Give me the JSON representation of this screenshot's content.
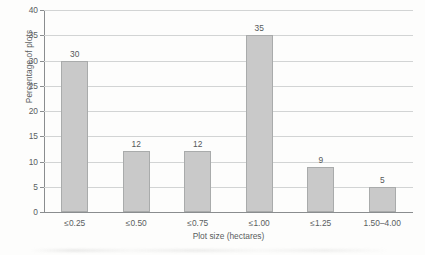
{
  "chart_data": {
    "type": "bar",
    "title": "",
    "subtitle": "",
    "xlabel": "Plot size (hectares)",
    "ylabel": "Percentage of plots",
    "categories": [
      "≤0.25",
      "≤0.50",
      "≤0.75",
      "≤1.00",
      "≤1.25",
      "1.50–4.00"
    ],
    "values": [
      30,
      12,
      12,
      35,
      9,
      5
    ],
    "data_labels": [
      "30",
      "12",
      "12",
      "35",
      "9",
      "5"
    ],
    "ylim": [
      0,
      40
    ],
    "ytick_step": 5,
    "ytick_labels": [
      "0",
      "5",
      "10",
      "15",
      "20",
      "25",
      "30",
      "35",
      "40"
    ],
    "ytick_values": [
      0,
      5,
      10,
      15,
      20,
      25,
      30,
      35,
      40
    ],
    "grid": "horizontal",
    "legend": "none",
    "legend_position": "none",
    "series": [
      {
        "name": "Percentage of plots",
        "values": [
          30,
          12,
          12,
          35,
          9,
          5
        ]
      }
    ]
  },
  "style": {
    "bar_fill": "#c9c9c9",
    "bar_border": "#a9abab",
    "gridline_color": "#d2d4d4",
    "axis_color": "#8a8d8f",
    "text_color": "#55585a",
    "background": "#fdfdfc"
  }
}
